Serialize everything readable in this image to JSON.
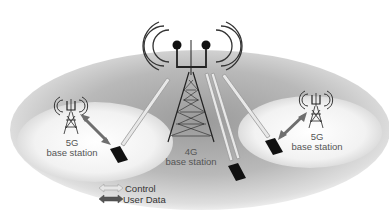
{
  "diagram": {
    "type": "heterogeneous-network-diagram",
    "macro_cell": {
      "label_line1": "4G",
      "label_line2": "base station"
    },
    "small_cells": [
      {
        "side": "left",
        "label_line1": "5G",
        "label_line2": "base station"
      },
      {
        "side": "right",
        "label_line1": "5G",
        "label_line2": "base station"
      }
    ],
    "legend": {
      "control_label": "Control",
      "user_data_label": "User Data"
    },
    "colors": {
      "macro_area": "#b8b8b8",
      "small_area": "#f4f4f4",
      "control_arrow": "#c8c8c8",
      "user_data_arrow": "#6e6e6e",
      "tower": "#222222",
      "device": "#1a1a1a"
    }
  }
}
